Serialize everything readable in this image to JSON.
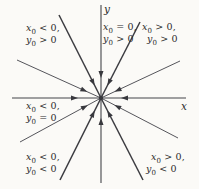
{
  "figure": {
    "kind": "phase-portrait of straight-line trajectories converging to the origin",
    "arrows_direction": "toward-origin",
    "axes": {
      "x_label": "x",
      "y_label": "y"
    },
    "colors": {
      "background": "#fbfaf7",
      "axis_line": "#44444a",
      "steep_line": "#3c3c41",
      "shallow_line": "#55555b",
      "arrow": "#38383d",
      "text": "#2b2b2b"
    },
    "labels": {
      "top_left": {
        "line1": {
          "var": "x",
          "sub": "0",
          "rel": "< 0,"
        },
        "line2": {
          "var": "y",
          "sub": "0",
          "rel": "> 0"
        }
      },
      "top_center": {
        "line1": {
          "var": "x",
          "sub": "0",
          "rel": "= 0,"
        },
        "line2": {
          "var": "y",
          "sub": "0",
          "rel": "> 0"
        }
      },
      "top_right": {
        "line1": {
          "var": "x",
          "sub": "0",
          "rel": "> 0,"
        },
        "line2": {
          "var": "y",
          "sub": "0",
          "rel": "> 0"
        }
      },
      "mid_left": {
        "line1": {
          "var": "x",
          "sub": "0",
          "rel": "< 0,"
        },
        "line2": {
          "var": "y",
          "sub": "0",
          "rel": "= 0"
        }
      },
      "bottom_left": {
        "line1": {
          "var": "x",
          "sub": "0",
          "rel": "< 0,"
        },
        "line2": {
          "var": "y",
          "sub": "0",
          "rel": "< 0"
        }
      },
      "bottom_right": {
        "line1": {
          "var": "x",
          "sub": "0",
          "rel": "> 0,"
        },
        "line2": {
          "var": "y",
          "sub": "0",
          "rel": "< 0"
        }
      }
    }
  }
}
